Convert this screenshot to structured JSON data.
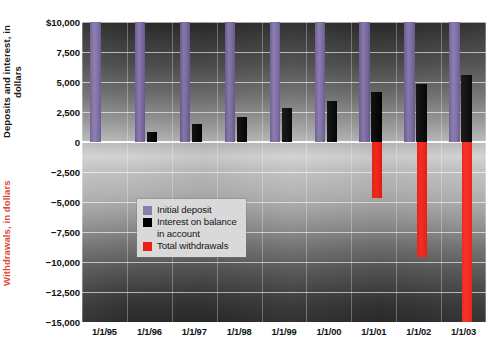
{
  "chart_data": {
    "type": "bar",
    "title": "",
    "subtitle": "",
    "xlabel": "",
    "ylabel": "Deposits and interest, in dollars",
    "ylabel_secondary": "Withdrawals, in dollars",
    "categories": [
      "1/1/95",
      "1/1/96",
      "1/1/97",
      "1/1/98",
      "1/1/99",
      "1/1/00",
      "1/1/01",
      "1/1/02",
      "1/1/03"
    ],
    "ylim": [
      -15000,
      10000
    ],
    "ytick_values": [
      10000,
      7500,
      5000,
      2500,
      0,
      -2500,
      -5000,
      -7500,
      -10000,
      -12500,
      -15000
    ],
    "ytick_labels": [
      "$10,000",
      "7,500",
      "5,000",
      "2,500",
      "0",
      "−2,500",
      "−5,000",
      "−7,500",
      "−10,000",
      "−12,500",
      "−15,000"
    ],
    "grid": true,
    "grid_axis": "both",
    "legend_position": "center-left-lower",
    "series": [
      {
        "name": "Initial deposit",
        "color": "#8a7bb0",
        "values": [
          10000,
          10000,
          10000,
          10000,
          10000,
          10000,
          10000,
          10000,
          10000
        ]
      },
      {
        "name": "Interest on balance\nin account",
        "color": "#000000",
        "values": [
          0,
          800,
          1500,
          2100,
          2850,
          3400,
          4150,
          4850,
          5600
        ]
      },
      {
        "name": "Total withdrawals",
        "color": "#f01d12",
        "values": [
          0,
          0,
          0,
          0,
          0,
          0,
          -4700,
          -9600,
          -15000
        ]
      }
    ]
  },
  "legend": {
    "items": [
      {
        "label": "Initial deposit",
        "swatch": "deposit"
      },
      {
        "label": "Interest on balance\nin account",
        "swatch": "interest"
      },
      {
        "label": "Total withdrawals",
        "swatch": "withdrawal"
      }
    ]
  },
  "colors": {
    "deposit": "#8a7bb0",
    "interest": "#000000",
    "withdrawal": "#f01d12",
    "axis_text": "#111111",
    "withdrawal_axis_text": "#e0483c"
  }
}
